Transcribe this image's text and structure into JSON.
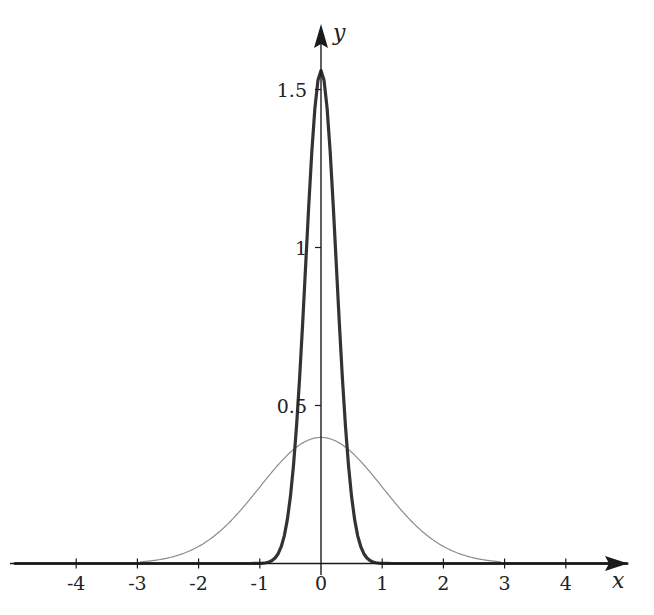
{
  "chart_data": {
    "type": "line",
    "title": "",
    "xlabel": "x",
    "ylabel": "y",
    "xlim": [
      -5.1,
      5.0
    ],
    "ylim": [
      0,
      1.65
    ],
    "grid": false,
    "legend": null,
    "x_ticks": [
      -4,
      -3,
      -2,
      -1,
      0,
      1,
      2,
      3,
      4
    ],
    "x_tick_labels": [
      "-4",
      "-3",
      "-2",
      "-1",
      "0",
      "1",
      "2",
      "3",
      "4"
    ],
    "y_ticks": [
      0.5,
      1,
      1.5
    ],
    "y_tick_labels": [
      "0.5",
      "1",
      "1.5"
    ],
    "series": [
      {
        "name": "standard normal density (sigma = 1)",
        "style": "thin gray",
        "color": "#8c8c8c",
        "mean": 0,
        "sigma": 1,
        "peak": 0.399,
        "x": [
          -4,
          -3,
          -2.5,
          -2,
          -1.5,
          -1,
          -0.5,
          0,
          0.5,
          1,
          1.5,
          2,
          2.5,
          3,
          4
        ],
        "values": [
          0.0001,
          0.0044,
          0.0175,
          0.054,
          0.1295,
          0.242,
          0.3521,
          0.3989,
          0.3521,
          0.242,
          0.1295,
          0.054,
          0.0175,
          0.0044,
          0.0001
        ]
      },
      {
        "name": "narrow normal density (sigma = 0.25)",
        "style": "thick dark",
        "color": "#333333",
        "mean": 0,
        "sigma": 0.25,
        "peak": 1.56,
        "x": [
          -5,
          -1,
          -0.8,
          -0.6,
          -0.5,
          -0.4,
          -0.3,
          -0.2,
          -0.1,
          0,
          0.1,
          0.2,
          0.3,
          0.4,
          0.5,
          0.6,
          0.8,
          1,
          5
        ],
        "values": [
          0,
          0.0005,
          0.0095,
          0.0897,
          0.216,
          0.4436,
          0.7767,
          1.1589,
          1.473,
          1.56,
          1.473,
          1.1589,
          0.7767,
          0.4436,
          0.216,
          0.0897,
          0.0095,
          0.0005,
          0
        ]
      }
    ]
  },
  "axes": {
    "x_name": "x",
    "y_name": "y",
    "axis_color": "#1a1a1a"
  }
}
